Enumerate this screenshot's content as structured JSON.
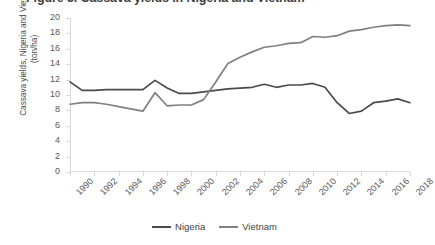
{
  "chart_title": "Figure 3. Cassava yields in Nigeria and Vietnam",
  "y_axis": {
    "label": "Cassava yields, Nigeria and Vietnam (ton/ha)",
    "ticks": [
      "0",
      "2",
      "4",
      "6",
      "8",
      "10",
      "12",
      "14",
      "16",
      "18",
      "20"
    ]
  },
  "x_axis": {
    "ticks": [
      "1990",
      "1992",
      "1994",
      "1996",
      "1998",
      "2000",
      "2002",
      "2004",
      "2006",
      "2008",
      "2010",
      "2012",
      "2014",
      "2016",
      "2018"
    ]
  },
  "legend": {
    "items": [
      {
        "label": "Nigeria",
        "color": "#4a4a4a"
      },
      {
        "label": "Vietnam",
        "color": "#808080"
      }
    ]
  },
  "chart_data": {
    "type": "line",
    "title": "Figure 3. Cassava yields in Nigeria and Vietnam",
    "xlabel": "",
    "ylabel": "Cassava yields, Nigeria and Vietnam (ton/ha)",
    "xlim": [
      1990,
      2018
    ],
    "ylim": [
      0,
      20
    ],
    "ytick_step": 2,
    "xtick_step": 2,
    "grid": false,
    "legend_position": "bottom-center",
    "x": [
      1990,
      1991,
      1992,
      1993,
      1994,
      1995,
      1996,
      1997,
      1998,
      1999,
      2000,
      2001,
      2002,
      2003,
      2004,
      2005,
      2006,
      2007,
      2008,
      2009,
      2010,
      2011,
      2012,
      2013,
      2014,
      2015,
      2016,
      2017,
      2018
    ],
    "series": [
      {
        "name": "Nigeria",
        "color": "#4a4a4a",
        "values": [
          11.7,
          10.6,
          10.6,
          10.7,
          10.7,
          10.7,
          10.7,
          11.9,
          10.9,
          10.2,
          10.2,
          10.4,
          10.6,
          10.8,
          10.9,
          11.0,
          11.4,
          11.0,
          11.3,
          11.3,
          11.5,
          11.0,
          9.0,
          7.6,
          7.9,
          9.0,
          9.2,
          9.5,
          9.0
        ]
      },
      {
        "name": "Vietnam",
        "color": "#808080",
        "values": [
          8.8,
          9.0,
          9.0,
          8.8,
          8.5,
          8.2,
          7.9,
          10.3,
          8.6,
          8.7,
          8.7,
          9.4,
          11.7,
          14.1,
          14.9,
          15.6,
          16.2,
          16.4,
          16.7,
          16.8,
          17.6,
          17.5,
          17.7,
          18.3,
          18.5,
          18.8,
          19.0,
          19.1,
          19.0
        ]
      }
    ]
  }
}
